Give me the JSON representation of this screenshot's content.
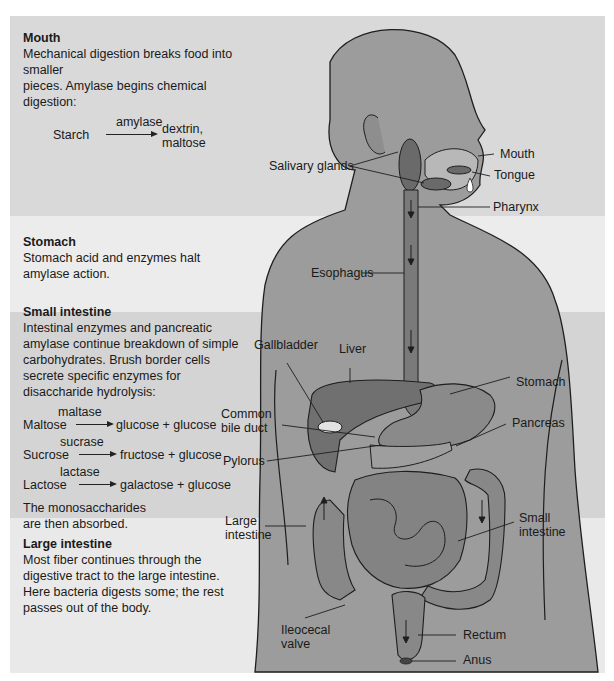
{
  "panels": {
    "mouth": {
      "title": "Mouth",
      "text_line1": "Mechanical digestion breaks food into smaller",
      "text_line2": "pieces. Amylase begins chemical digestion:",
      "reaction": {
        "substrate": "Starch",
        "enzyme": "amylase",
        "product_line1": "dextrin,",
        "product_line2": "maltose"
      }
    },
    "stomach": {
      "title": "Stomach",
      "text_line1": "Stomach acid and enzymes halt",
      "text_line2": "amylase action."
    },
    "small_intestine": {
      "title": "Small intestine",
      "text_lines": [
        "Intestinal enzymes and pancreatic",
        "amylase continue breakdown of simple",
        "carbohydrates. Brush border cells",
        "secrete specific enzymes for",
        "disaccharide hydrolysis:"
      ],
      "reactions": [
        {
          "substrate": "Maltose",
          "enzyme": "maltase",
          "product": "glucose  + glucose"
        },
        {
          "substrate": "Sucrose",
          "enzyme": "sucrase",
          "product": "fructose + glucose"
        },
        {
          "substrate": "Lactose",
          "enzyme": "lactase",
          "product": "galactose + glucose"
        }
      ],
      "footer_line1": "The monosaccharides",
      "footer_line2": "are then absorbed."
    },
    "large_intestine": {
      "title": "Large intestine",
      "text_lines": [
        "Most fiber continues through the",
        "digestive tract to the large intestine.",
        "Here bacteria digests some; the rest",
        "passes out of the body."
      ]
    }
  },
  "anatomy_labels": {
    "salivary_glands": "Salivary glands",
    "mouth": "Mouth",
    "tongue": "Tongue",
    "pharynx": "Pharynx",
    "esophagus": "Esophagus",
    "gallbladder": "Gallbladder",
    "liver": "Liver",
    "stomach": "Stomach",
    "common_bile_duct_line1": "Common",
    "common_bile_duct_line2": "bile duct",
    "pancreas": "Pancreas",
    "pylorus": "Pylorus",
    "large_intestine_line1": "Large",
    "large_intestine_line2": "intestine",
    "small_intestine_line1": "Small",
    "small_intestine_line2": "intestine",
    "ileocecal_valve_line1": "Ileocecal",
    "ileocecal_valve_line2": "valve",
    "rectum": "Rectum",
    "anus": "Anus"
  },
  "colors": {
    "body": "#9a9a9a",
    "organ": "#7c7c7c",
    "organ_dark": "#5e5e5e",
    "outline": "#1e1e1e"
  }
}
